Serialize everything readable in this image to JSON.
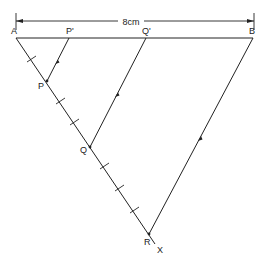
{
  "diagram": {
    "type": "geometric-construction",
    "dimension": {
      "label": "8cm",
      "from": "A",
      "to": "B"
    },
    "points": {
      "A": {
        "label": "A",
        "x": 16,
        "y": 38
      },
      "B": {
        "label": "B",
        "x": 253,
        "y": 38
      },
      "P_prime": {
        "label": "P'",
        "x": 69,
        "y": 38
      },
      "Q_prime": {
        "label": "Q'",
        "x": 146,
        "y": 38
      },
      "P": {
        "label": "P",
        "x": 47,
        "y": 81
      },
      "Q": {
        "label": "Q",
        "x": 90,
        "y": 147
      },
      "R": {
        "label": "R",
        "x": 149,
        "y": 234
      },
      "X": {
        "label": "X"
      }
    },
    "segments": [
      {
        "from": "A",
        "to": "B"
      },
      {
        "from": "A",
        "to": "X"
      },
      {
        "from": "P",
        "to": "P_prime",
        "arrow": true
      },
      {
        "from": "Q",
        "to": "Q_prime",
        "arrow": true
      },
      {
        "from": "R",
        "to": "B",
        "arrow": true
      }
    ],
    "equal_divisions_on_AX": 7,
    "stroke_color": "#222222"
  }
}
